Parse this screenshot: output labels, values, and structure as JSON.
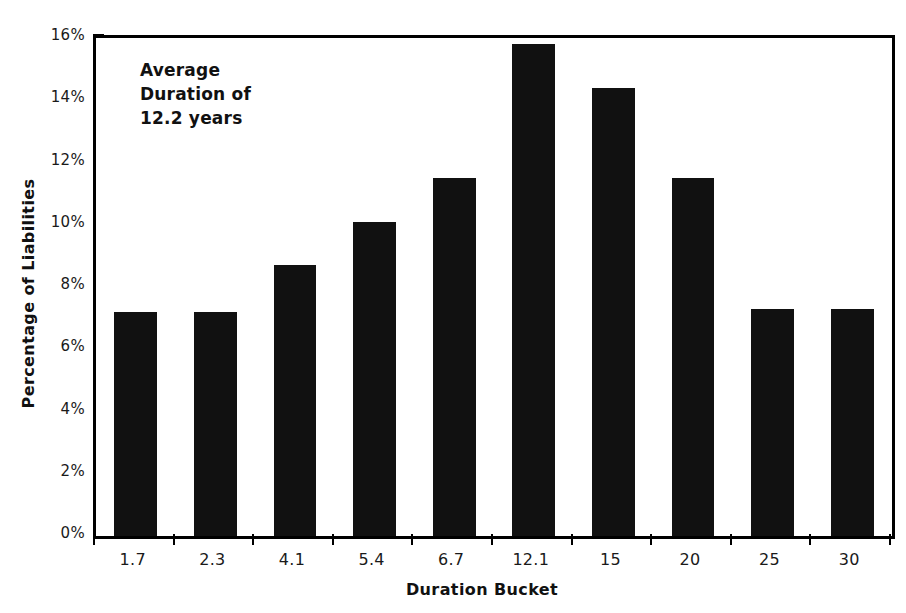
{
  "chart_data": {
    "type": "bar",
    "title": "",
    "subtitle": "",
    "xlabel": "Duration Bucket",
    "ylabel": "Percentage of Liabilities",
    "categories": [
      "1.7",
      "2.3",
      "4.1",
      "5.4",
      "6.7",
      "12.1",
      "15",
      "20",
      "25",
      "30"
    ],
    "values": [
      7.2,
      7.2,
      8.7,
      10.1,
      11.5,
      15.8,
      14.4,
      11.5,
      7.3,
      7.3
    ],
    "value_labels": [
      "7.2%",
      "7.2%",
      "8.7%",
      "10.1%",
      "11.5%",
      "15.8%",
      "14.4%",
      "11.5%",
      "7.3%",
      "7.3%"
    ],
    "ylim": [
      0,
      16
    ],
    "ytick_values": [
      0,
      2,
      4,
      6,
      8,
      10,
      12,
      14,
      16
    ],
    "ytick_labels": [
      "0%",
      "2%",
      "4%",
      "6%",
      "8%",
      "10%",
      "12%",
      "14%",
      "16%"
    ],
    "grid": false,
    "legend": null,
    "legend_position": "none",
    "bar_color": "#111111",
    "annotations": [
      {
        "lines": [
          "Average",
          "Duration of",
          "12.2 years"
        ],
        "position": "upper-left"
      }
    ]
  },
  "colors": {
    "background": "#ffffff",
    "axis": "#000000",
    "bar": "#111111",
    "text": "#1a1a1a"
  }
}
